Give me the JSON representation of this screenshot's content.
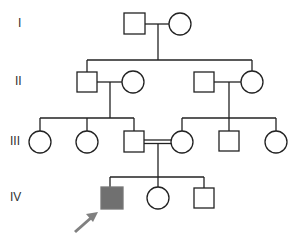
{
  "diagram": {
    "type": "pedigree",
    "generations": [
      {
        "label": "I",
        "y": 24
      },
      {
        "label": "II",
        "y": 82
      },
      {
        "label": "III",
        "y": 142
      },
      {
        "label": "IV",
        "y": 198
      }
    ],
    "colors": {
      "line": "#222222",
      "affected_fill": "#707070",
      "unaffected_fill": "#ffffff",
      "arrow": "#808080"
    },
    "individuals": [
      {
        "id": "I-1",
        "sex": "male",
        "affected": false,
        "x": 134,
        "y": 24
      },
      {
        "id": "I-2",
        "sex": "female",
        "affected": false,
        "x": 180,
        "y": 24
      },
      {
        "id": "II-1",
        "sex": "male",
        "affected": false,
        "x": 87,
        "y": 82
      },
      {
        "id": "II-2",
        "sex": "female",
        "affected": false,
        "x": 133,
        "y": 82
      },
      {
        "id": "II-3",
        "sex": "male",
        "affected": false,
        "x": 204,
        "y": 82
      },
      {
        "id": "II-4",
        "sex": "female",
        "affected": false,
        "x": 252,
        "y": 82
      },
      {
        "id": "III-1",
        "sex": "female",
        "affected": false,
        "x": 40,
        "y": 142
      },
      {
        "id": "III-2",
        "sex": "female",
        "affected": false,
        "x": 87,
        "y": 142
      },
      {
        "id": "III-3",
        "sex": "male",
        "affected": false,
        "x": 134,
        "y": 142
      },
      {
        "id": "III-4",
        "sex": "female",
        "affected": false,
        "x": 182,
        "y": 142
      },
      {
        "id": "III-5",
        "sex": "male",
        "affected": false,
        "x": 229,
        "y": 142
      },
      {
        "id": "III-6",
        "sex": "female",
        "affected": false,
        "x": 276,
        "y": 142
      },
      {
        "id": "IV-1",
        "sex": "male",
        "affected": true,
        "proband": true,
        "x": 112,
        "y": 198
      },
      {
        "id": "IV-2",
        "sex": "female",
        "affected": false,
        "x": 158,
        "y": 198
      },
      {
        "id": "IV-3",
        "sex": "male",
        "affected": false,
        "x": 204,
        "y": 198
      }
    ],
    "matings": [
      {
        "partners": [
          "I-1",
          "I-2"
        ],
        "consanguineous": false
      },
      {
        "partners": [
          "II-1",
          "II-2"
        ],
        "consanguineous": false
      },
      {
        "partners": [
          "II-3",
          "II-4"
        ],
        "consanguineous": false
      },
      {
        "partners": [
          "III-3",
          "III-4"
        ],
        "consanguineous": true
      }
    ],
    "proband_marker": "arrow"
  }
}
